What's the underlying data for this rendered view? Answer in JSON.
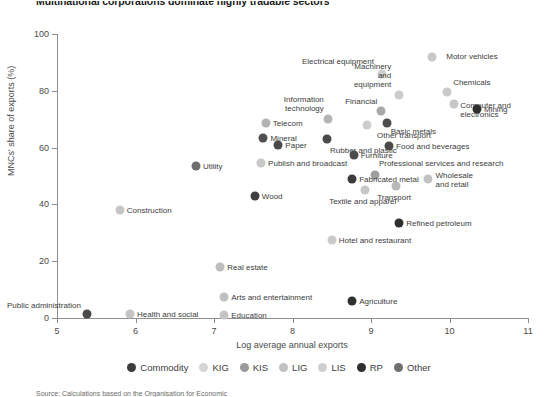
{
  "title": "Multinational corporations dominate highly tradable sectors",
  "source_note": "Source: Calculations based on the Organisation for Economic",
  "axes": {
    "x": {
      "label": "Log average annual exports",
      "min": 5,
      "max": 11,
      "ticks": [
        5,
        6,
        7,
        8,
        9,
        10,
        11
      ]
    },
    "y": {
      "label": "MNCs' share of exports (%)",
      "min": 0,
      "max": 100,
      "ticks": [
        0,
        20,
        40,
        60,
        80,
        100
      ]
    }
  },
  "legend": [
    {
      "name": "Commodity",
      "color": "#3b3b3b"
    },
    {
      "name": "KIG",
      "color": "#d4d4d4"
    },
    {
      "name": "KIS",
      "color": "#9a9a9a"
    },
    {
      "name": "LIG",
      "color": "#c2c2c2"
    },
    {
      "name": "LIS",
      "color": "#cfcfcf"
    },
    {
      "name": "RP",
      "color": "#2f2f2f"
    },
    {
      "name": "Other",
      "color": "#6f6f6f"
    }
  ],
  "chart_data": {
    "type": "scatter",
    "title": "Multinational corporations dominate highly tradable sectors",
    "xlabel": "Log average annual exports",
    "ylabel": "MNCs' share of exports (%)",
    "xlim": [
      5,
      11
    ],
    "ylim": [
      0,
      100
    ],
    "grid": false,
    "legend_position": "bottom",
    "series": [
      {
        "name": "Commodity",
        "color": "#3b3b3b"
      },
      {
        "name": "KIG",
        "color": "#d4d4d4"
      },
      {
        "name": "KIS",
        "color": "#9a9a9a"
      },
      {
        "name": "LIG",
        "color": "#c2c2c2"
      },
      {
        "name": "LIS",
        "color": "#cfcfcf"
      },
      {
        "name": "RP",
        "color": "#2f2f2f"
      },
      {
        "name": "Other",
        "color": "#6f6f6f"
      }
    ],
    "points": [
      {
        "label": "Motor vehicles",
        "x": 9.78,
        "y": 92.0,
        "group": "KIG",
        "color": "#c8c8c8",
        "lx": 14,
        "ly": -5,
        "align": "left"
      },
      {
        "label": "Electrical equipment",
        "x": 9.14,
        "y": 86.0,
        "group": "KIG",
        "color": "#cfcfcf",
        "lx": -8,
        "ly": -17,
        "align": "right"
      },
      {
        "label": "Machinery\nand\nequipment",
        "x": 9.36,
        "y": 78.5,
        "group": "KIG",
        "color": "#cccccc",
        "lx": -8,
        "ly": -33,
        "align": "right"
      },
      {
        "label": "Chemicals",
        "x": 9.97,
        "y": 79.5,
        "group": "KIG",
        "color": "#c9c9c9",
        "lx": 6,
        "ly": -14,
        "align": "left"
      },
      {
        "label": "Computer and electronics",
        "x": 10.06,
        "y": 75.5,
        "group": "KIG",
        "color": "#c6c6c6",
        "lx": 6,
        "ly": -3,
        "align": "left"
      },
      {
        "label": "Mining",
        "x": 10.35,
        "y": 73.5,
        "group": "Commodity",
        "color": "#2e2e2e",
        "lx": 7,
        "ly": -4,
        "align": "left"
      },
      {
        "label": "Financial",
        "x": 9.13,
        "y": 73.0,
        "group": "KIS",
        "color": "#a9a9a9",
        "lx": -4,
        "ly": -14,
        "align": "right"
      },
      {
        "label": "Information\ntechnology",
        "x": 8.45,
        "y": 70.0,
        "group": "KIS",
        "color": "#b5b5b5",
        "lx": -4,
        "ly": -24,
        "align": "right"
      },
      {
        "label": "Basic metals",
        "x": 9.2,
        "y": 68.5,
        "group": "Other",
        "color": "#4c4c4c",
        "lx": 4,
        "ly": 4,
        "align": "left"
      },
      {
        "label": "Other transport",
        "x": 8.95,
        "y": 68.0,
        "group": "LIG",
        "color": "#cdcdcd",
        "lx": 10,
        "ly": 6,
        "align": "left"
      },
      {
        "label": "Telecom",
        "x": 7.66,
        "y": 68.5,
        "group": "KIS",
        "color": "#b3b3b3",
        "lx": 7,
        "ly": -4,
        "align": "left"
      },
      {
        "label": "Mineral",
        "x": 7.63,
        "y": 63.5,
        "group": "Other",
        "color": "#4f4f4f",
        "lx": 7,
        "ly": -4,
        "align": "left"
      },
      {
        "label": "Paper",
        "x": 7.82,
        "y": 61.0,
        "group": "Other",
        "color": "#4a4a4a",
        "lx": 7,
        "ly": -4,
        "align": "left"
      },
      {
        "label": "Rubber and plastic",
        "x": 8.44,
        "y": 63.0,
        "group": "Other",
        "color": "#4a4a4a",
        "lx": 3,
        "ly": 7,
        "align": "left"
      },
      {
        "label": "Food and beverages",
        "x": 9.23,
        "y": 60.5,
        "group": "Other",
        "color": "#4a4a4a",
        "lx": 7,
        "ly": -4,
        "align": "left"
      },
      {
        "label": "Furniture",
        "x": 8.78,
        "y": 57.5,
        "group": "Other",
        "color": "#4c4c4c",
        "lx": 7,
        "ly": -4,
        "align": "left"
      },
      {
        "label": "Publish and broadcast",
        "x": 7.6,
        "y": 54.5,
        "group": "LIS",
        "color": "#c8c8c8",
        "lx": 7,
        "ly": -4,
        "align": "left"
      },
      {
        "label": "Utility",
        "x": 6.77,
        "y": 53.5,
        "group": "Other",
        "color": "#6e6e6e",
        "lx": 7,
        "ly": -4,
        "align": "left"
      },
      {
        "label": "Professional services and research",
        "x": 9.05,
        "y": 50.5,
        "group": "KIS",
        "color": "#9f9f9f",
        "lx": 4,
        "ly": -16,
        "align": "left"
      },
      {
        "label": "Fabricated metal",
        "x": 8.76,
        "y": 49.0,
        "group": "Other",
        "color": "#3c3c3c",
        "lx": 7,
        "ly": -4,
        "align": "left"
      },
      {
        "label": "Wholesale\nand retail",
        "x": 9.72,
        "y": 49.0,
        "group": "LIS",
        "color": "#c2c2c2",
        "lx": 8,
        "ly": -8,
        "align": "left"
      },
      {
        "label": "Transport",
        "x": 9.32,
        "y": 46.5,
        "group": "LIS",
        "color": "#b8b8b8",
        "lx": -2,
        "ly": 7,
        "align": "center"
      },
      {
        "label": "Textile and apparel",
        "x": 8.92,
        "y": 45.0,
        "group": "LIG",
        "color": "#c6c6c6",
        "lx": -2,
        "ly": 7,
        "align": "center"
      },
      {
        "label": "Wood",
        "x": 7.52,
        "y": 43.0,
        "group": "Other",
        "color": "#3f3f3f",
        "lx": 7,
        "ly": -4,
        "align": "left"
      },
      {
        "label": "Construction",
        "x": 5.8,
        "y": 38.0,
        "group": "LIS",
        "color": "#c6c6c6",
        "lx": 7,
        "ly": -4,
        "align": "left"
      },
      {
        "label": "Refined petroleum",
        "x": 9.36,
        "y": 33.5,
        "group": "RP",
        "color": "#2f2f2f",
        "lx": 7,
        "ly": -4,
        "align": "left"
      },
      {
        "label": "Hotel and restaurant",
        "x": 8.5,
        "y": 27.5,
        "group": "LIS",
        "color": "#cacaca",
        "lx": 7,
        "ly": -4,
        "align": "left"
      },
      {
        "label": "Real estate",
        "x": 7.08,
        "y": 18.0,
        "group": "LIS",
        "color": "#bdbdbd",
        "lx": 7,
        "ly": -4,
        "align": "left"
      },
      {
        "label": "Arts and entertainment",
        "x": 7.13,
        "y": 7.5,
        "group": "LIS",
        "color": "#c0c0c0",
        "lx": 7,
        "ly": -4,
        "align": "left"
      },
      {
        "label": "Agriculture",
        "x": 8.76,
        "y": 6.0,
        "group": "Commodity",
        "color": "#303030",
        "lx": 7,
        "ly": -4,
        "align": "left"
      },
      {
        "label": "Public administration",
        "x": 5.38,
        "y": 1.5,
        "group": "Other",
        "color": "#4a4a4a",
        "lx": -6,
        "ly": -13,
        "align": "right"
      },
      {
        "label": "Health and social",
        "x": 5.93,
        "y": 1.5,
        "group": "LIS",
        "color": "#c4c4c4",
        "lx": 7,
        "ly": -4,
        "align": "left"
      },
      {
        "label": "Education",
        "x": 7.13,
        "y": 1.0,
        "group": "LIS",
        "color": "#c4c4c4",
        "lx": 7,
        "ly": -4,
        "align": "left"
      }
    ]
  }
}
